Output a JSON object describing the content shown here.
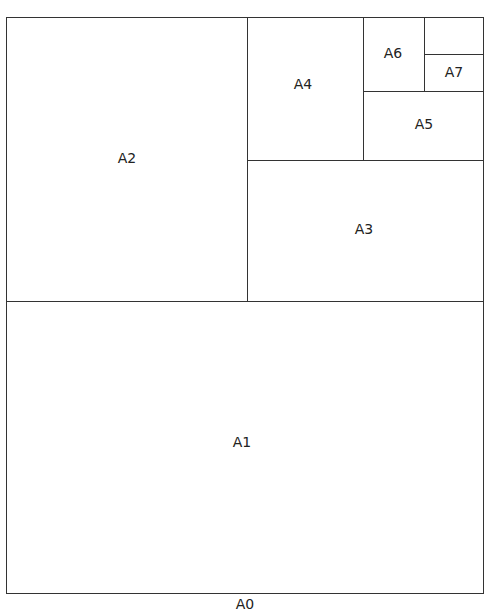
{
  "sheets": {
    "a0": "A0",
    "a1": "A1",
    "a2": "A2",
    "a3": "A3",
    "a4": "A4",
    "a5": "A5",
    "a6": "A6",
    "a7": "A7"
  },
  "colors": {
    "line": "#333333",
    "background": "#ffffff"
  }
}
